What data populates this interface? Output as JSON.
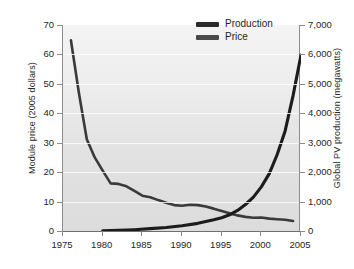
{
  "chart_data": {
    "type": "line",
    "title": "",
    "xlabel": "",
    "ylabel": "Module price (2005 dollars)",
    "y2label": "Global PV production (megawatts)",
    "xlim": [
      1975,
      2005
    ],
    "ylim": [
      0,
      70
    ],
    "y2lim": [
      0,
      7000
    ],
    "xticks": [
      "1975",
      "1980",
      "1985",
      "1990",
      "1995",
      "2000",
      "2005"
    ],
    "yticks": [
      "0",
      "10",
      "20",
      "30",
      "40",
      "50",
      "60",
      "70"
    ],
    "y2ticks": [
      "0",
      "1,000",
      "2,000",
      "3,000",
      "4,000",
      "5,000",
      "6,000",
      "7,000"
    ],
    "grid": true,
    "legend_position": "top-right",
    "legend": [
      "Production",
      "Price"
    ],
    "series": [
      {
        "name": "Price",
        "axis": "left",
        "units": "2005 dollars per watt",
        "color": "#333333",
        "x": [
          1976,
          1977,
          1978,
          1979,
          1980,
          1981,
          1982,
          1983,
          1984,
          1985,
          1986,
          1987,
          1988,
          1989,
          1990,
          1991,
          1992,
          1993,
          1994,
          1995,
          1996,
          1997,
          1998,
          1999,
          2000,
          2001,
          2002,
          2003,
          2004
        ],
        "values": [
          64.8,
          47.0,
          31.2,
          25.0,
          20.5,
          16.2,
          16.0,
          15.2,
          13.6,
          12.0,
          11.5,
          10.5,
          9.6,
          8.8,
          8.6,
          8.9,
          8.8,
          8.3,
          7.6,
          6.8,
          6.0,
          5.3,
          4.8,
          4.5,
          4.6,
          4.2,
          4.0,
          3.8,
          3.4
        ]
      },
      {
        "name": "Production",
        "axis": "right",
        "units": "megawatts",
        "color": "#1e1e1e",
        "x": [
          1980,
          1982,
          1984,
          1986,
          1988,
          1990,
          1992,
          1994,
          1995,
          1996,
          1997,
          1998,
          1999,
          2000,
          2001,
          2002,
          2003,
          2004,
          2005
        ],
        "values": [
          5,
          20,
          45,
          80,
          120,
          180,
          260,
          380,
          450,
          550,
          700,
          900,
          1150,
          1500,
          1950,
          2600,
          3400,
          4600,
          5980
        ]
      }
    ]
  },
  "axes": {
    "left_title": "Module price (2005 dollars)",
    "right_title": "Global PV production (megawatts)",
    "left_ticks": [
      "70",
      "60",
      "50",
      "40",
      "30",
      "20",
      "10",
      "0"
    ],
    "right_ticks": [
      "7,000",
      "6,000",
      "5,000",
      "4,000",
      "3,000",
      "2,000",
      "1,000",
      "0"
    ],
    "bottom_ticks": [
      "1975",
      "1980",
      "1985",
      "1990",
      "1995",
      "2000",
      "2005"
    ]
  },
  "legend": {
    "items": [
      {
        "label": "Production",
        "swatch": "production-swatch"
      },
      {
        "label": "Price",
        "swatch": "price-swatch"
      }
    ]
  }
}
